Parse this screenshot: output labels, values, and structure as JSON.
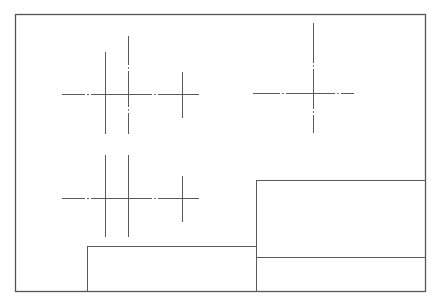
{
  "drawing": {
    "width": 439,
    "height": 305,
    "colors": {
      "background": "#ffffff",
      "border": "#555555",
      "line": "#5a5a5a"
    },
    "frame": {
      "x": 15,
      "y": 14,
      "w": 410,
      "h": 277
    },
    "crosshair_groups": [
      {
        "name": "upper-left-group",
        "horizontal": {
          "y": 94,
          "x1": 62,
          "x2": 199,
          "dash_gaps": [
            88,
            155
          ]
        },
        "verticals": [
          {
            "x": 105,
            "y1": 52,
            "y2": 134
          },
          {
            "x": 128,
            "y1": 36,
            "y2": 134,
            "dash_gaps": [
              68,
              110
            ]
          },
          {
            "x": 182,
            "y1": 72,
            "y2": 118
          }
        ]
      },
      {
        "name": "lower-left-group",
        "horizontal": {
          "y": 198,
          "x1": 62,
          "x2": 199,
          "dash_gaps": [
            88,
            155
          ]
        },
        "verticals": [
          {
            "x": 105,
            "y1": 155,
            "y2": 237
          },
          {
            "x": 128,
            "y1": 155,
            "y2": 237
          },
          {
            "x": 182,
            "y1": 176,
            "y2": 222
          }
        ]
      },
      {
        "name": "upper-right-crosshair",
        "horizontal": {
          "y": 93,
          "x1": 253,
          "x2": 354,
          "dash_gaps": [
            283,
            338
          ]
        },
        "verticals": [
          {
            "x": 313,
            "y1": 23,
            "y2": 133,
            "dash_gaps": [
              66,
              112
            ]
          }
        ]
      }
    ],
    "boxes": [
      {
        "name": "lower-left-box",
        "x": 87,
        "y": 246,
        "w": 169,
        "h": 45
      },
      {
        "name": "right-upper-box",
        "x": 256,
        "y": 180,
        "w": 169,
        "h": 77
      },
      {
        "name": "right-lower-box",
        "x": 256,
        "y": 257,
        "w": 169,
        "h": 34
      }
    ]
  }
}
